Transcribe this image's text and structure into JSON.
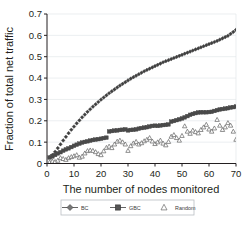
{
  "chart_data": {
    "type": "scatter",
    "title": "",
    "xlabel": "The number of nodes monitored",
    "ylabel": "Fraction of total net traffic",
    "xlim": [
      0,
      70
    ],
    "ylim": [
      0,
      0.7
    ],
    "xticks": [
      "0",
      "10",
      "20",
      "30",
      "40",
      "50",
      "60",
      "70"
    ],
    "xtick_values": [
      0,
      10,
      20,
      30,
      40,
      50,
      60,
      70
    ],
    "yticks": [
      "0",
      "0.1",
      "0.2",
      "0.3",
      "0.4",
      "0.5",
      "0.6",
      "0.7"
    ],
    "ytick_values": [
      0,
      0.1,
      0.2,
      0.3,
      0.4,
      0.5,
      0.6,
      0.7
    ],
    "grid": "horizontal-faint",
    "legend_position": "below-axis",
    "x": [
      1,
      2,
      3,
      4,
      5,
      6,
      7,
      8,
      9,
      10,
      11,
      12,
      13,
      14,
      15,
      16,
      17,
      18,
      19,
      20,
      21,
      22,
      23,
      24,
      25,
      26,
      27,
      28,
      29,
      30,
      31,
      32,
      33,
      34,
      35,
      36,
      37,
      38,
      39,
      40,
      41,
      42,
      43,
      44,
      45,
      46,
      47,
      48,
      49,
      50,
      51,
      52,
      53,
      54,
      55,
      56,
      57,
      58,
      59,
      60,
      61,
      62,
      63,
      64,
      65,
      66,
      67,
      68,
      69,
      70
    ],
    "series": [
      {
        "name": "BC",
        "marker": "diamond",
        "color": "#3f3f3f",
        "values": [
          0.03,
          0.04,
          0.055,
          0.072,
          0.09,
          0.108,
          0.125,
          0.142,
          0.158,
          0.173,
          0.188,
          0.202,
          0.216,
          0.229,
          0.242,
          0.254,
          0.266,
          0.277,
          0.288,
          0.299,
          0.309,
          0.319,
          0.329,
          0.338,
          0.347,
          0.356,
          0.365,
          0.373,
          0.381,
          0.389,
          0.397,
          0.404,
          0.411,
          0.418,
          0.425,
          0.432,
          0.438,
          0.444,
          0.45,
          0.456,
          0.462,
          0.468,
          0.474,
          0.479,
          0.484,
          0.489,
          0.494,
          0.499,
          0.504,
          0.509,
          0.514,
          0.519,
          0.524,
          0.529,
          0.534,
          0.539,
          0.544,
          0.549,
          0.554,
          0.559,
          0.564,
          0.569,
          0.574,
          0.58,
          0.586,
          0.592,
          0.598,
          0.607,
          0.616,
          0.626
        ]
      },
      {
        "name": "GBC",
        "marker": "square",
        "color": "#4a4a4a",
        "values": [
          0.028,
          0.033,
          0.04,
          0.047,
          0.053,
          0.06,
          0.066,
          0.071,
          0.077,
          0.083,
          0.088,
          0.093,
          0.098,
          0.101,
          0.104,
          0.107,
          0.11,
          0.112,
          0.114,
          0.116,
          0.119,
          0.121,
          0.15,
          0.152,
          0.154,
          0.155,
          0.157,
          0.158,
          0.16,
          0.155,
          0.157,
          0.158,
          0.16,
          0.163,
          0.166,
          0.168,
          0.17,
          0.173,
          0.176,
          0.177,
          0.176,
          0.178,
          0.18,
          0.181,
          0.183,
          0.196,
          0.199,
          0.203,
          0.207,
          0.211,
          0.216,
          0.222,
          0.228,
          0.232,
          0.236,
          0.239,
          0.24,
          0.24,
          0.24,
          0.241,
          0.242,
          0.246,
          0.25,
          0.253,
          0.255,
          0.257,
          0.259,
          0.262,
          0.264,
          0.267
        ]
      },
      {
        "name": "Random",
        "marker": "triangle",
        "color": "#6b6b6b",
        "values": [
          0.006,
          0.01,
          0.008,
          0.014,
          0.026,
          0.022,
          0.018,
          0.026,
          0.031,
          0.035,
          0.04,
          0.028,
          0.033,
          0.048,
          0.059,
          0.062,
          0.06,
          0.054,
          0.045,
          0.04,
          0.058,
          0.074,
          0.08,
          0.073,
          0.09,
          0.103,
          0.108,
          0.1,
          0.09,
          0.06,
          0.082,
          0.095,
          0.102,
          0.09,
          0.096,
          0.105,
          0.112,
          0.12,
          0.104,
          0.092,
          0.1,
          0.108,
          0.094,
          0.086,
          0.102,
          0.126,
          0.134,
          0.12,
          0.108,
          0.13,
          0.175,
          0.15,
          0.14,
          0.155,
          0.148,
          0.142,
          0.158,
          0.17,
          0.182,
          0.16,
          0.15,
          0.165,
          0.205,
          0.178,
          0.158,
          0.17,
          0.19,
          0.178,
          0.15,
          0.112
        ]
      }
    ],
    "legend": [
      {
        "label": "BC",
        "marker": "diamond"
      },
      {
        "label": "GBC",
        "marker": "square"
      },
      {
        "label": "Random",
        "marker": "triangle"
      }
    ]
  },
  "colors": {
    "axis": "#231f20",
    "grid": "#e2e6ea",
    "text": "#231f20",
    "legend_border": "#b9bdc2",
    "background": "#ffffff"
  }
}
